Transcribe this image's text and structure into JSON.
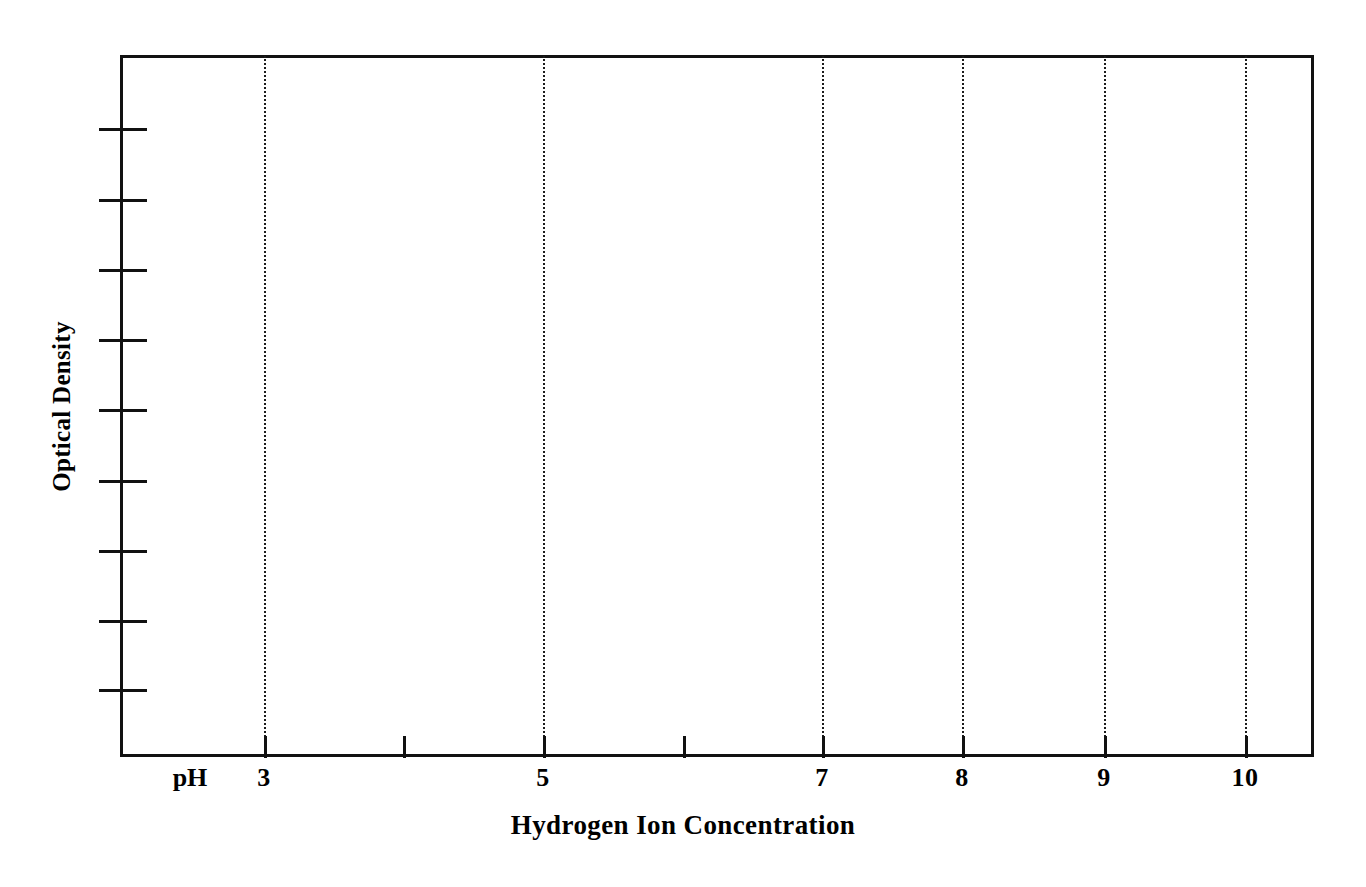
{
  "figure": {
    "background_color": "#ffffff",
    "axis_color": "#111111",
    "gridline_color": "#1b1b1b"
  },
  "axis_labels": {
    "x_title": "Hydrogen Ion Concentration",
    "y_title": "Optical Density",
    "x_prefix": "pH"
  },
  "scan_artifact": {
    "ghost_text": "bleed-through"
  },
  "chart_data": {
    "type": "line",
    "title": "",
    "subtitle": "",
    "xlabel": "Hydrogen Ion Concentration",
    "ylabel": "Optical Density",
    "x_prefix_label": "pH",
    "xlim": [
      2.5,
      10.5
    ],
    "ylim": [
      0,
      1
    ],
    "grid": true,
    "grid_orientation": "vertical",
    "grid_style": "dotted",
    "legend": null,
    "legend_position": "none",
    "series": [],
    "values": [],
    "categories": [],
    "note": "Empty plot template: axes frame with tick marks and vertical dotted gridlines; no data plotted.",
    "x_ticks": [
      {
        "value": 3,
        "label": "3",
        "gridline": true,
        "px": 264
      },
      {
        "value": 4,
        "label": "",
        "gridline": false,
        "px": 403
      },
      {
        "value": 5,
        "label": "5",
        "gridline": true,
        "px": 543
      },
      {
        "value": 6,
        "label": "",
        "gridline": false,
        "px": 683
      },
      {
        "value": 7,
        "label": "7",
        "gridline": true,
        "px": 822
      },
      {
        "value": 8,
        "label": "8",
        "gridline": true,
        "px": 962
      },
      {
        "value": 9,
        "label": "9",
        "gridline": true,
        "px": 1104
      },
      {
        "value": 10,
        "label": "10",
        "gridline": true,
        "px": 1245
      }
    ],
    "y_ticks": [
      {
        "label": "",
        "px": 128
      },
      {
        "label": "",
        "px": 199
      },
      {
        "label": "",
        "px": 269
      },
      {
        "label": "",
        "px": 339
      },
      {
        "label": "",
        "px": 409
      },
      {
        "label": "",
        "px": 480
      },
      {
        "label": "",
        "px": 550
      },
      {
        "label": "",
        "px": 620
      },
      {
        "label": "",
        "px": 689
      }
    ],
    "plot_box": {
      "left": 120,
      "top": 55,
      "right": 1314,
      "bottom": 757
    }
  }
}
